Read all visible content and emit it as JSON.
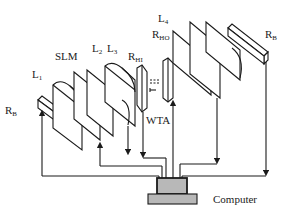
{
  "figure": {
    "type": "optical-setup-schematic",
    "colors": {
      "stroke": "#1a1a1a",
      "background": "#ffffff",
      "computer_fill": "#b8b8b8"
    },
    "labels": {
      "rb_left": {
        "main": "R",
        "sub": "B"
      },
      "l1": {
        "main": "L",
        "sub": "1"
      },
      "slm": {
        "main": "SLM"
      },
      "l2": {
        "main": "L",
        "sub": "2"
      },
      "l3": {
        "main": "L",
        "sub": "3"
      },
      "rhi": {
        "main": "R",
        "sub": "HI"
      },
      "wta": {
        "main": "WTA"
      },
      "rho": {
        "main": "R",
        "sub": "HO"
      },
      "l4": {
        "main": "L",
        "sub": "4"
      },
      "rb_right": {
        "main": "R",
        "sub": "B"
      },
      "computer": {
        "main": "Computer"
      }
    },
    "components": [
      "R_B (left retina bar)",
      "L1 lens",
      "SLM plane",
      "L2 plane",
      "L3 lens",
      "R_HI detector",
      "WTA connection",
      "R_HO detector",
      "L4 lens",
      "output plane",
      "R_B (right retina bar)",
      "Computer"
    ]
  }
}
